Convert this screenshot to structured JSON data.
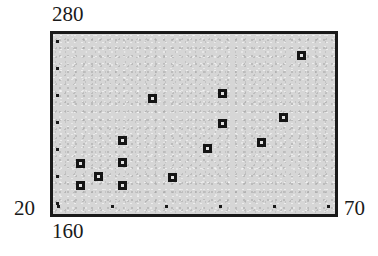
{
  "figure": {
    "background_color": "#ffffff",
    "panel_color": "#d6d6d6",
    "ink_color": "#1a1a1a"
  },
  "axes": {
    "y_max_label": "280",
    "y_min_label": "20",
    "x_min_label": "160",
    "x_max_label": "70",
    "y_tick_count": 7,
    "x_tick_count": 6
  },
  "chart_data": {
    "type": "scatter",
    "title": "",
    "xlabel": "",
    "ylabel": "",
    "xlim": [
      160,
      70
    ],
    "ylim": [
      20,
      280
    ],
    "grid": false,
    "legend": null,
    "marker": "square-with-light-center",
    "x_tick_labels": [
      "160",
      "",
      "",
      "",
      "",
      "70"
    ],
    "y_tick_labels": [
      "280",
      "",
      "",
      "",
      "",
      "",
      "20"
    ],
    "points": [
      {
        "x": 169,
        "y": 109
      },
      {
        "x": 175,
        "y": 91
      },
      {
        "x": 169,
        "y": 78
      },
      {
        "x": 182,
        "y": 137
      },
      {
        "x": 182,
        "y": 109
      },
      {
        "x": 182,
        "y": 78
      },
      {
        "x": 192,
        "y": 187
      },
      {
        "x": 198,
        "y": 88
      },
      {
        "x": 210,
        "y": 120
      },
      {
        "x": 215,
        "y": 198
      },
      {
        "x": 215,
        "y": 157
      },
      {
        "x": 226,
        "y": 131
      },
      {
        "x": 233,
        "y": 166
      },
      {
        "x": 239,
        "y": 240
      },
      {
        "x": 163,
        "y": 268
      }
    ],
    "points_px": [
      {
        "left": 80,
        "top": 163
      },
      {
        "left": 98,
        "top": 176
      },
      {
        "left": 80,
        "top": 185
      },
      {
        "left": 122,
        "top": 140
      },
      {
        "left": 122,
        "top": 162
      },
      {
        "left": 122,
        "top": 185
      },
      {
        "left": 152,
        "top": 98
      },
      {
        "left": 172,
        "top": 177
      },
      {
        "left": 207,
        "top": 148
      },
      {
        "left": 222,
        "top": 93
      },
      {
        "left": 222,
        "top": 123
      },
      {
        "left": 261,
        "top": 142
      },
      {
        "left": 283,
        "top": 117
      },
      {
        "left": 301,
        "top": 55
      }
    ]
  }
}
